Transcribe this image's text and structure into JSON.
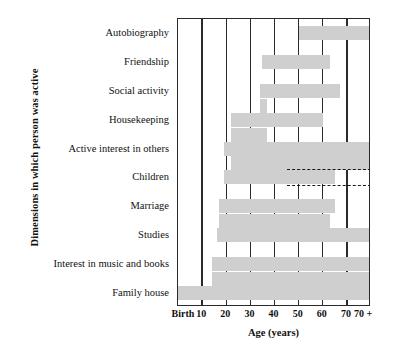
{
  "chart_data": {
    "type": "bar",
    "title": "",
    "subtitle": "",
    "xlabel": "Age (years)",
    "ylabel": "Dimensions in which person was active",
    "grid": true,
    "legend": false,
    "orientation": "horizontal",
    "bar_color": "#cfcfcf",
    "axis_color": "#2a2a2a",
    "xlim": [
      0,
      8
    ],
    "xtick_labels": [
      "Birth",
      "10",
      "20",
      "30",
      "40",
      "50",
      "60",
      "70",
      "70 +"
    ],
    "xtick_values": [
      0,
      1,
      2,
      3,
      4,
      5,
      6,
      7,
      8
    ],
    "categories": [
      "Autobiography",
      "Friendship",
      "Social activity",
      "Housekeeping",
      "Active interest in others",
      "Children",
      "Marriage",
      "Studies",
      "Interest in music and books",
      "Family house"
    ],
    "note": "Each bar is a span of ages during which the dimension was active; some rows are stepped (multiple segments at different sub-heights).",
    "bars": [
      {
        "category": "Autobiography",
        "segments": [
          {
            "start_age": 50,
            "end_age": 80,
            "label": "50 to 70+"
          }
        ]
      },
      {
        "category": "Friendship",
        "segments": [
          {
            "start_age": 35,
            "end_age": 63,
            "label": "35 to 63"
          }
        ]
      },
      {
        "category": "Social activity",
        "segments": [
          {
            "start_age": 34,
            "end_age": 67,
            "label": "34 to 67"
          }
        ]
      },
      {
        "category": "Housekeeping",
        "segments": [
          {
            "start_age": 22,
            "end_age": 60,
            "label": "22 to 60"
          },
          {
            "start_age": 34,
            "end_age": 37,
            "label": "riser at 34-37"
          }
        ]
      },
      {
        "category": "Active interest in others",
        "segments": [
          {
            "start_age": 19,
            "end_age": 80,
            "label": "19 to 70+"
          },
          {
            "start_age": 22,
            "end_age": 37,
            "label": "riser at 22-37"
          }
        ]
      },
      {
        "category": "Children",
        "segments": [
          {
            "start_age": 19,
            "end_age": 65,
            "label": "19 to 65"
          },
          {
            "start_age": 22,
            "end_age": 80,
            "label": "22 to 70+ (lower tier)"
          }
        ],
        "dashed_lines": [
          {
            "start_age": 45,
            "end_age": 80,
            "position": "upper"
          },
          {
            "start_age": 45,
            "end_age": 80,
            "position": "lower"
          }
        ]
      },
      {
        "category": "Marriage",
        "segments": [
          {
            "start_age": 17,
            "end_age": 65,
            "label": "17 to 65"
          }
        ]
      },
      {
        "category": "Studies",
        "segments": [
          {
            "start_age": 16,
            "end_age": 80,
            "label": "16 to 70+"
          },
          {
            "start_age": 17,
            "end_age": 63,
            "label": "riser at 17-63"
          }
        ]
      },
      {
        "category": "Interest in music and books",
        "segments": [
          {
            "start_age": 14,
            "end_age": 80,
            "label": "14 to 70+"
          }
        ]
      },
      {
        "category": "Family house",
        "segments": [
          {
            "start_age": 0,
            "end_age": 80,
            "label": "Birth to 70+"
          },
          {
            "start_age": 14,
            "end_age": 80,
            "label": "riser from 14"
          }
        ]
      }
    ]
  },
  "axis": {
    "x_title": "Age (years)",
    "y_title": "Dimensions in which person was active"
  }
}
